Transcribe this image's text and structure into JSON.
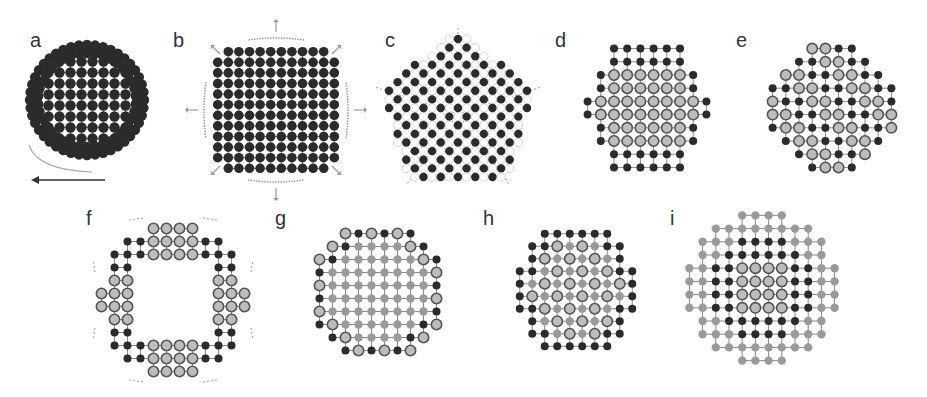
{
  "figure": {
    "colors": {
      "dark": "#2b2b2b",
      "ring_fill": "#bdbdbd",
      "ring_stroke": "#555555",
      "light": "#9a9a9a",
      "bond": "#8a8a8a",
      "arrow": "#9a9a9a",
      "label": "#333333"
    },
    "panels": [
      {
        "label": "a",
        "label_x": 30,
        "label_y": 30,
        "cx": 87,
        "cy": 100,
        "kind": "disk_dense",
        "r": 58,
        "spacing": 11,
        "dot": 5.2,
        "caption_arrow": "rotation-arrow"
      },
      {
        "label": "b",
        "label_x": 173,
        "label_y": 30,
        "cx": 276,
        "cy": 110,
        "kind": "square",
        "n": 12,
        "spacing": 10.6,
        "dot": 4.8,
        "caption_arrow": "expansion-arrows"
      },
      {
        "label": "c",
        "label_x": 385,
        "label_y": 30,
        "cx": 458,
        "cy": 108,
        "kind": "pentagon",
        "R": 82,
        "spacing": 11.5,
        "dot": 4.2
      },
      {
        "label": "d",
        "label_x": 555,
        "label_y": 30,
        "cx": 647,
        "cy": 108,
        "kind": "hex_core_shell",
        "r": 66,
        "spacing": 13.2,
        "core_r": 47
      },
      {
        "label": "e",
        "label_x": 736,
        "label_y": 30,
        "cx": 832,
        "cy": 108,
        "kind": "mixed_disk",
        "r": 64,
        "spacing": 13.2
      },
      {
        "label": "f",
        "label_x": 86,
        "label_y": 208,
        "cx": 173,
        "cy": 300,
        "kind": "ring",
        "r_out": 73,
        "r_in": 34,
        "spacing": 13
      },
      {
        "label": "g",
        "label_x": 275,
        "label_y": 208,
        "cx": 378,
        "cy": 292,
        "kind": "shell_mixed",
        "r": 68,
        "spacing": 13,
        "core_r": 50
      },
      {
        "label": "h",
        "label_x": 483,
        "label_y": 208,
        "cx": 576,
        "cy": 290,
        "kind": "hex_alternating",
        "r": 66,
        "spacing": 12.5,
        "core_r": 48
      },
      {
        "label": "i",
        "label_x": 670,
        "label_y": 208,
        "cx": 762,
        "cy": 288,
        "kind": "three_layer",
        "r": 78,
        "spacing": 13.2,
        "mid_r": 56,
        "core_r": 32
      }
    ]
  }
}
